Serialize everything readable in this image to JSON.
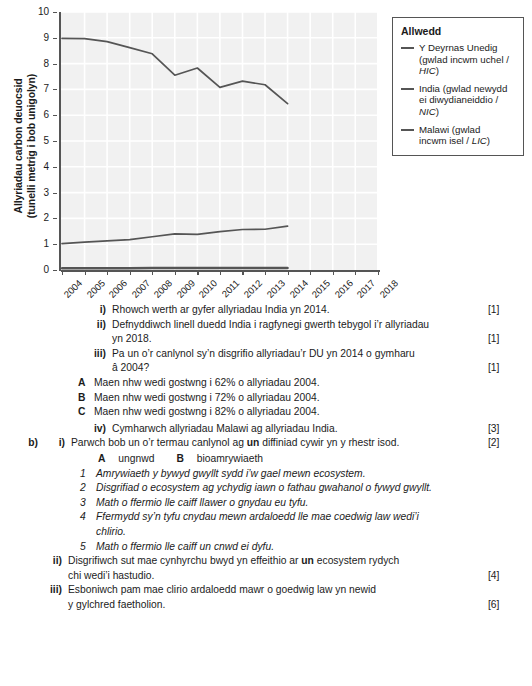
{
  "chart_data": {
    "type": "line",
    "title": "",
    "xlabel": "",
    "ylabel": "Allyriadau carbon deuocsid (tunelli metrig i bob unigolyn)",
    "ylabel_line1": "Allyriadau carbon deuocsid",
    "ylabel_line2": "(tunelli metrig i bob unigolyn)",
    "ylim": [
      0,
      10
    ],
    "ytick_labels": [
      "0",
      "1",
      "2",
      "3",
      "4",
      "5",
      "6",
      "7",
      "8",
      "9",
      "10"
    ],
    "x": [
      2004,
      2005,
      2006,
      2007,
      2008,
      2009,
      2010,
      2011,
      2012,
      2013,
      2014,
      2015,
      2016,
      2017,
      2018
    ],
    "xtick_labels": [
      "2004",
      "2005",
      "2006",
      "2007",
      "2008",
      "2009",
      "2010",
      "2011",
      "2012",
      "2013",
      "2014",
      "2015",
      "2016",
      "2017",
      "2018"
    ],
    "grid": true,
    "legend_position": "right-outside",
    "plot_background": "#f1f1f1",
    "line_color": "#555555",
    "series": [
      {
        "name": "Y Deyrnas Unedig (gwlad incwm uchel / HIC)",
        "x": [
          2004,
          2005,
          2006,
          2007,
          2008,
          2009,
          2010,
          2011,
          2012,
          2013,
          2014
        ],
        "values": [
          8.98,
          8.97,
          8.85,
          8.62,
          8.38,
          7.55,
          7.83,
          7.08,
          7.32,
          7.18,
          6.45
        ]
      },
      {
        "name": "India (gwlad newydd ei diwydianeiddio / NIC)",
        "x": [
          2004,
          2005,
          2006,
          2007,
          2008,
          2009,
          2010,
          2011,
          2012,
          2013,
          2014
        ],
        "values": [
          1.02,
          1.08,
          1.13,
          1.18,
          1.29,
          1.4,
          1.38,
          1.49,
          1.57,
          1.58,
          1.7
        ]
      },
      {
        "name": "Malawi (gwlad incwm isel / LIC)",
        "x": [
          2004,
          2005,
          2006,
          2007,
          2008,
          2009,
          2010,
          2011,
          2012,
          2013,
          2014
        ],
        "values": [
          0.07,
          0.07,
          0.07,
          0.07,
          0.08,
          0.08,
          0.08,
          0.08,
          0.08,
          0.08,
          0.08
        ]
      }
    ]
  },
  "legend": {
    "title": "Allwedd",
    "entries": [
      {
        "line1": "Y Deyrnas Unedig",
        "line2_pre": "(gwlad incwm uchel / ",
        "line2_italic": "HIC",
        "line2_post": ")"
      },
      {
        "line1": "India (gwlad newydd",
        "line2_pre": "ei diwydianeiddio / ",
        "line2_italic": "NIC",
        "line2_post": ")"
      },
      {
        "line1": "Malawi (gwlad",
        "line2_pre": "incwm isel / ",
        "line2_italic": "LIC",
        "line2_post": ")"
      }
    ]
  },
  "questions": {
    "a": {
      "i": {
        "label": "i)",
        "text": "Rhowch werth ar gyfer allyriadau India yn 2014.",
        "marks": "[1]"
      },
      "ii": {
        "label": "ii)",
        "line1": "Defnyddiwch linell duedd India i ragfynegi gwerth tebygol i’r allyriadau",
        "line2": "yn 2018.",
        "marks": "[1]"
      },
      "iii": {
        "label": "iii)",
        "line1": "Pa un o’r canlynol sy’n disgrifio allyriadau’r DU yn 2014 o gymharu",
        "line2": "â 2004?",
        "marks": "[1]",
        "options": [
          {
            "letter": "A",
            "text": "Maen nhw wedi gostwng i 62% o allyriadau 2004."
          },
          {
            "letter": "B",
            "text": "Maen nhw wedi gostwng i 72% o allyriadau 2004."
          },
          {
            "letter": "C",
            "text": "Maen nhw wedi gostwng i 82% o allyriadau 2004."
          }
        ]
      },
      "iv": {
        "label": "iv)",
        "text": "Cymharwch allyriadau Malawi ag allyriadau India.",
        "marks": "[3]"
      }
    },
    "b": {
      "label": "b)",
      "i": {
        "label": "i)",
        "text_pre": "Parwch bob un o’r termau canlynol ag ",
        "text_bold": "un",
        "text_post": " diffiniad cywir yn y rhestr isod.",
        "marks": "[2]",
        "terms": [
          {
            "letter": "A",
            "text": "ungnwd"
          },
          {
            "letter": "B",
            "text": "bioamrywiaeth"
          }
        ],
        "definitions": [
          {
            "num": "1",
            "line1": "Amrywiaeth y bywyd gwyllt sydd i’w gael mewn ecosystem.",
            "line2": ""
          },
          {
            "num": "2",
            "line1": "Disgrifiad o ecosystem ag ychydig iawn o fathau gwahanol o fywyd gwyllt.",
            "line2": ""
          },
          {
            "num": "3",
            "line1": "Math o ffermio lle caiff llawer o gnydau eu tyfu.",
            "line2": ""
          },
          {
            "num": "4",
            "line1": "Ffermydd sy’n tyfu cnydau mewn ardaloedd lle mae coedwig law wedi’i",
            "line2": "chlirio."
          },
          {
            "num": "5",
            "line1": "Math o ffermio lle caiff un cnwd ei dyfu.",
            "line2": ""
          }
        ]
      },
      "ii": {
        "label": "ii)",
        "line1_pre": "Disgrifiwch sut mae cynhyrchu bwyd yn effeithio ar ",
        "line1_bold": "un",
        "line1_post": " ecosystem rydych",
        "line2": "chi wedi’i hastudio.",
        "marks": "[4]"
      },
      "iii": {
        "label": "iii)",
        "line1": "Esboniwch pam mae clirio ardaloedd mawr o goedwig law yn newid",
        "line2": "y gylchred faetholion.",
        "marks": "[6]"
      }
    }
  }
}
